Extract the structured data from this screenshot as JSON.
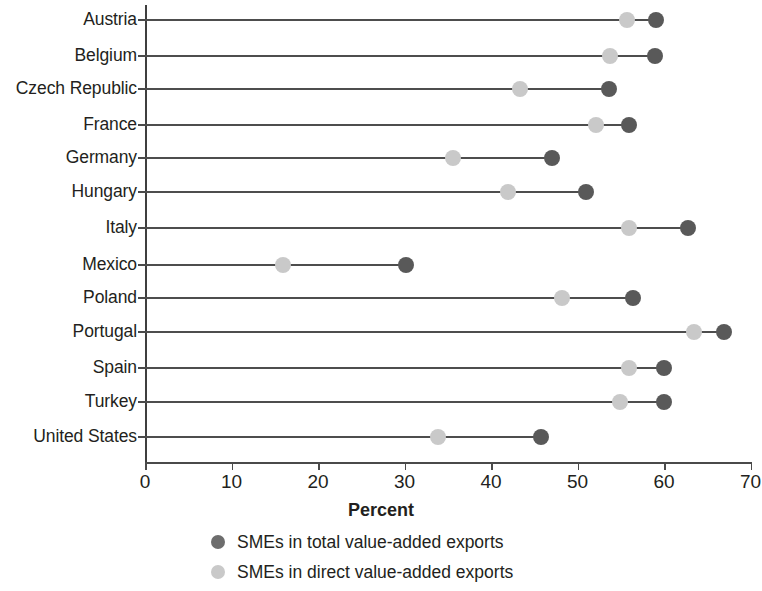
{
  "chart_data": {
    "type": "scatter",
    "subtype": "dumbbell",
    "title": "",
    "xlabel": "Percent",
    "ylabel": "",
    "xlim": [
      0,
      70
    ],
    "xticks": [
      0,
      10,
      20,
      30,
      40,
      50,
      60,
      70
    ],
    "grid": false,
    "legend_position": "bottom",
    "categories": [
      "Austria",
      "Belgium",
      "Czech Republic",
      "France",
      "Germany",
      "Hungary",
      "Italy",
      "Mexico",
      "Poland",
      "Portugal",
      "Spain",
      "Turkey",
      "United States"
    ],
    "series": [
      {
        "name": "SMEs in total value-added exports",
        "color": "#595959",
        "values": [
          59.1,
          59.0,
          53.6,
          56.0,
          47.0,
          51.0,
          62.8,
          30.2,
          56.4,
          66.9,
          60.0,
          60.0,
          45.8
        ]
      },
      {
        "name": "SMEs in direct value-added exports",
        "color": "#c9c9c9",
        "values": [
          55.7,
          53.8,
          43.3,
          52.1,
          35.6,
          42.0,
          56.0,
          15.9,
          48.2,
          63.5,
          56.0,
          54.9,
          33.9
        ]
      }
    ],
    "tick_labels": [
      "0",
      "10",
      "20",
      "30",
      "40",
      "50",
      "60",
      "70"
    ]
  },
  "axis": {
    "x_title": "Percent"
  },
  "legend": {
    "items": [
      {
        "label": "SMEs in total value-added exports",
        "swatch": "dark-circle-icon"
      },
      {
        "label": "SMEs in direct value-added exports",
        "swatch": "light-circle-icon"
      }
    ]
  }
}
